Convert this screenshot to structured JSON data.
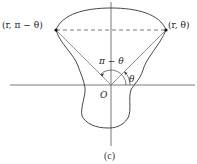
{
  "diagram": {
    "caption": "(c)",
    "origin_label": "O",
    "left_point_label": "(r, π − θ)",
    "right_point_label": "(r, θ)",
    "angle_supplement_label": "π − θ",
    "angle_label": "θ",
    "colors": {
      "curve": "#333333",
      "axes": "#555555",
      "rays": "#777777",
      "dashed": "#555555",
      "points": "#111111"
    }
  }
}
